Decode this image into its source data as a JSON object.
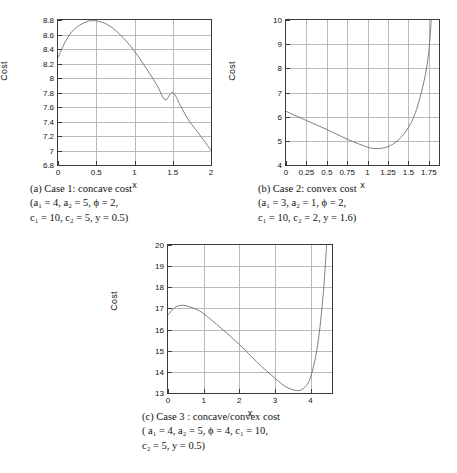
{
  "document": {
    "kind": "figure-group",
    "axis_label_y": "Cost",
    "axis_label_x": "x"
  },
  "figures": [
    {
      "id": "a",
      "caption_lines": [
        "(a) Case 1: concave cost",
        "(a₁ = 4, a₂ = 5, ϕ = 2,",
        "c₁ = 10, c₂ = 5, y = 0.5)"
      ],
      "caption_label": "(a)",
      "caption_title": "Case 1: concave cost",
      "params": {
        "a1": "4",
        "a2": "5",
        "phi": "2",
        "c1": "10",
        "c2": "5",
        "y": "0.5"
      }
    },
    {
      "id": "b",
      "caption_lines": [
        "(b) Case 2: convex cost",
        "(a₁ = 3, a₂ = 1, ϕ = 2,",
        "c₁ = 10, c₂ = 2, y = 1.6)"
      ],
      "caption_label": "(b)",
      "caption_title": "Case 2: convex cost",
      "params": {
        "a1": "3",
        "a2": "1",
        "phi": "2",
        "c1": "10",
        "c2": "2",
        "y": "1.6"
      }
    },
    {
      "id": "c",
      "caption_lines": [
        "(c) Case 3 : concave/convex cost",
        "( a₁ = 4, a₂ = 5, ϕ = 4, c₁ = 10,",
        "c₂ = 5, y = 0.5)"
      ],
      "caption_label": "(c)",
      "caption_title": "Case 3 : concave/convex cost",
      "params": {
        "a1": "4",
        "a2": "5",
        "phi": "4",
        "c1": "10",
        "c2": "5",
        "y": "0.5"
      }
    }
  ],
  "chart_data": [
    {
      "type": "line",
      "id": "a",
      "title": "Case 1: concave cost",
      "xlabel": "x",
      "ylabel": "Cost",
      "xlim": [
        0,
        2
      ],
      "ylim": [
        6.8,
        8.8
      ],
      "xticks": [
        0,
        0.5,
        1,
        1.5,
        2
      ],
      "xticklabels": [
        "0",
        "0.5",
        "1",
        "1.5",
        "2"
      ],
      "yticks": [
        6.8,
        7,
        7.2,
        7.4,
        7.6,
        7.8,
        8,
        8.2,
        8.4,
        8.6,
        8.8
      ],
      "yticklabels": [
        "6.8",
        "7",
        "7.2",
        "7.4",
        "7.6",
        "7.8",
        "8",
        "8.2",
        "8.4",
        "8.6",
        "8.8"
      ],
      "grid": true,
      "legend": null,
      "line_color": "#6f6f6f",
      "series": [
        {
          "name": "cost",
          "x": [
            0,
            0.1,
            0.2,
            0.3,
            0.4,
            0.47,
            0.5,
            0.6,
            0.7,
            0.8,
            0.9,
            1.0,
            1.1,
            1.2,
            1.3,
            1.4,
            1.5,
            1.6,
            1.7,
            1.8,
            1.9,
            2.0
          ],
          "values": [
            8.28,
            8.51,
            8.66,
            8.74,
            8.785,
            8.79,
            8.788,
            8.76,
            8.7,
            8.61,
            8.5,
            8.37,
            8.22,
            8.06,
            7.89,
            7.7,
            7.8,
            7.62,
            7.43,
            7.29,
            7.15,
            7.0
          ]
        }
      ],
      "annotations": {
        "start_value": 8.28,
        "max_value": 8.79,
        "max_at_x": 0.47,
        "end_value": 7.0
      }
    },
    {
      "type": "line",
      "id": "b",
      "title": "Case 2: convex cost",
      "xlabel": "x",
      "ylabel": "Cost",
      "xlim": [
        0,
        1.875
      ],
      "ylim": [
        4,
        10
      ],
      "xticks": [
        0,
        0.25,
        0.5,
        0.75,
        1,
        1.25,
        1.5,
        1.75
      ],
      "xticklabels": [
        "0",
        "0.25",
        "0.5",
        "0.75",
        "1",
        "1.25",
        "1.5",
        "1.75"
      ],
      "yticks": [
        4,
        5,
        6,
        7,
        8,
        9,
        10
      ],
      "yticklabels": [
        "4",
        "5",
        "6",
        "7",
        "8",
        "9",
        "10"
      ],
      "grid": true,
      "legend": null,
      "line_color": "#6f6f6f",
      "series": [
        {
          "name": "cost",
          "x": [
            0,
            0.25,
            0.5,
            0.75,
            1.0,
            1.12,
            1.25,
            1.375,
            1.5,
            1.6,
            1.7,
            1.75,
            1.78
          ],
          "values": [
            6.22,
            5.84,
            5.47,
            5.07,
            4.74,
            4.68,
            4.76,
            5.03,
            5.55,
            6.3,
            7.6,
            8.7,
            10.0
          ]
        }
      ],
      "annotations": {
        "start_value": 6.22,
        "min_value": 4.68,
        "min_at_x": 1.12,
        "end_value": 10.0
      }
    },
    {
      "type": "line",
      "id": "c",
      "title": "Case 3 : concave/convex cost",
      "xlabel": "x",
      "ylabel": "Cost",
      "xlim": [
        0,
        4.6
      ],
      "ylim": [
        13,
        20
      ],
      "xticks": [
        0,
        1,
        2,
        3,
        4
      ],
      "xticklabels": [
        "0",
        "1",
        "2",
        "3",
        "4"
      ],
      "yticks": [
        13,
        14,
        15,
        16,
        17,
        18,
        19,
        20
      ],
      "yticklabels": [
        "13",
        "14",
        "15",
        "16",
        "17",
        "18",
        "19",
        "20"
      ],
      "grid": true,
      "legend": null,
      "line_color": "#6f6f6f",
      "series": [
        {
          "name": "cost",
          "x": [
            0,
            0.2,
            0.4,
            0.6,
            0.8,
            1.0,
            1.5,
            2.0,
            2.5,
            3.0,
            3.3,
            3.6,
            3.8,
            4.0,
            4.2,
            4.35,
            4.45
          ],
          "values": [
            16.7,
            17.05,
            17.15,
            17.08,
            16.95,
            16.75,
            16.05,
            15.3,
            14.45,
            13.7,
            13.3,
            13.12,
            13.22,
            13.75,
            15.3,
            17.6,
            20.0
          ]
        }
      ],
      "annotations": {
        "start_value": 16.7,
        "local_max_value": 17.15,
        "local_max_at_x": 0.4,
        "min_value": 13.12,
        "min_at_x": 3.6,
        "end_value": 20.0
      }
    }
  ]
}
